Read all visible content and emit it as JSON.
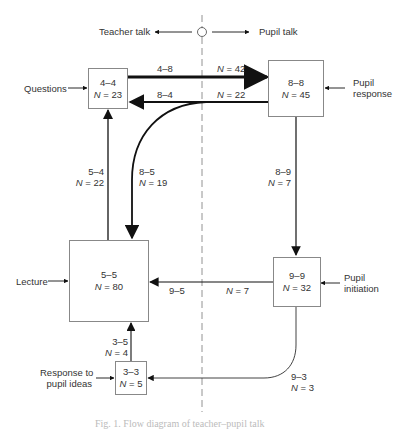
{
  "header": {
    "left_label": "Teacher talk",
    "right_label": "Pupil talk"
  },
  "nodes": [
    {
      "id": "4-4",
      "code": "4–4",
      "n": "23",
      "input_label": "Questions"
    },
    {
      "id": "8-8",
      "code": "8–8",
      "n": "45",
      "input_label": "Pupil response"
    },
    {
      "id": "5-5",
      "code": "5–5",
      "n": "80",
      "input_label": "Lecture"
    },
    {
      "id": "9-9",
      "code": "9–9",
      "n": "32",
      "input_label": "Pupil initiation"
    },
    {
      "id": "3-3",
      "code": "3–3",
      "n": "5",
      "input_label": "Response to pupil ideas"
    }
  ],
  "labels": {
    "questions_line1": "Questions",
    "pupil_response_line1": "Pupil",
    "pupil_response_line2": "response",
    "lecture": "Lecture",
    "pupil_initiation_line1": "Pupil",
    "pupil_initiation_line2": "initiation",
    "response_line1": "Response to",
    "response_line2": "pupil ideas",
    "n_prefix": "N",
    "eq": " = "
  },
  "edges": [
    {
      "from": "4-4",
      "to": "8-8",
      "code": "4–8",
      "n": "42",
      "weight": "heavy"
    },
    {
      "from": "8-8",
      "to": "4-4",
      "code": "8–4",
      "n": "22",
      "weight": "medium"
    },
    {
      "from": "8-8",
      "to": "5-5",
      "code": "8–5",
      "n": "19",
      "weight": "medium"
    },
    {
      "from": "5-5",
      "to": "4-4",
      "code": "5–4",
      "n": "22",
      "weight": "light"
    },
    {
      "from": "8-8",
      "to": "9-9",
      "code": "8–9",
      "n": "7",
      "weight": "light"
    },
    {
      "from": "9-9",
      "to": "5-5",
      "code": "9–5",
      "n": "7",
      "weight": "light"
    },
    {
      "from": "3-3",
      "to": "5-5",
      "code": "3–5",
      "n": "4",
      "weight": "light"
    },
    {
      "from": "9-9",
      "to": "3-3",
      "code": "9–3",
      "n": "3",
      "weight": "thin"
    }
  ],
  "caption": "Fig. 1. Flow diagram of teacher–pupil talk"
}
